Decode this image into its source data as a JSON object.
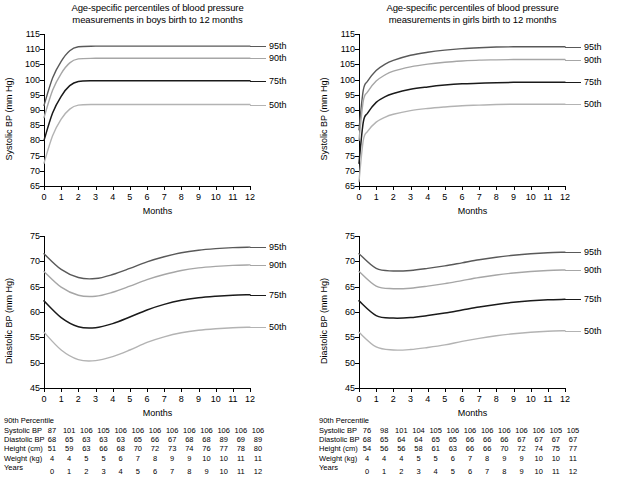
{
  "figure": {
    "title_shared_line1": "Age-specific percentiles of blood pressure",
    "panels": [
      {
        "id": "boys",
        "title_line1": "Age-specific percentiles of blood pressure",
        "title_line2": "measurements in boys birth to 12 months"
      },
      {
        "id": "girls",
        "title_line1": "Age-specific percentiles of blood pressure",
        "title_line2": "measurements in girls birth to 12 months"
      }
    ]
  },
  "common": {
    "xlabel": "Months",
    "percentile_labels": [
      "95th",
      "90th",
      "75th",
      "50th"
    ],
    "table_header": "90th Percentile",
    "table_row_labels": [
      "Systolic BP",
      "Diastolic BP",
      "Height (cm)",
      "Weight (kg)",
      "Years"
    ],
    "colors": {
      "p95": "#595959",
      "p90": "#a6a6a6",
      "p75": "#1a1a1a",
      "p50": "#b3b3b3",
      "axis": "#000000",
      "background": "#ffffff"
    }
  },
  "chart_data": [
    {
      "type": "line",
      "id": "boys-systolic",
      "title": "Age-specific percentiles of blood pressure measurements in boys birth to 12 months",
      "xlabel": "Months",
      "ylabel": "Systolic BP (mm Hg)",
      "xlim": [
        0,
        12
      ],
      "ylim": [
        65,
        115
      ],
      "xticks": [
        0,
        1,
        2,
        3,
        4,
        5,
        6,
        7,
        8,
        9,
        10,
        11,
        12
      ],
      "yticks": [
        65,
        70,
        75,
        80,
        85,
        90,
        95,
        100,
        105,
        110,
        115
      ],
      "grid": false,
      "legend_position": "right-inline",
      "x": [
        0,
        0.5,
        1,
        1.5,
        2,
        3,
        4,
        5,
        6,
        7,
        8,
        9,
        10,
        11,
        12
      ],
      "series": [
        {
          "name": "95th",
          "values": [
            91.5,
            100.5,
            106.0,
            109.5,
            110.8,
            111.0,
            111.0,
            111.0,
            111.0,
            111.0,
            111.0,
            111.0,
            111.0,
            111.0,
            111.0
          ]
        },
        {
          "name": "90th",
          "values": [
            87.5,
            96.5,
            102.0,
            105.5,
            106.8,
            107.0,
            107.0,
            107.0,
            107.0,
            107.0,
            107.0,
            107.0,
            107.0,
            107.0,
            107.0
          ]
        },
        {
          "name": "75th",
          "values": [
            80.0,
            89.0,
            94.5,
            98.0,
            99.4,
            99.6,
            99.6,
            99.6,
            99.6,
            99.6,
            99.6,
            99.6,
            99.6,
            99.6,
            99.6
          ]
        },
        {
          "name": "50th",
          "values": [
            72.5,
            81.5,
            87.0,
            90.3,
            91.6,
            91.8,
            91.8,
            91.8,
            91.8,
            91.8,
            91.8,
            91.8,
            91.8,
            91.8,
            91.8
          ]
        }
      ]
    },
    {
      "type": "line",
      "id": "girls-systolic",
      "title": "Age-specific percentiles of blood pressure measurements in girls birth to 12 months",
      "xlabel": "Months",
      "ylabel": "Systolic BP (mm Hg)",
      "xlim": [
        0,
        12
      ],
      "ylim": [
        65,
        115
      ],
      "xticks": [
        0,
        1,
        2,
        3,
        4,
        5,
        6,
        7,
        8,
        9,
        10,
        11,
        12
      ],
      "yticks": [
        65,
        70,
        75,
        80,
        85,
        90,
        95,
        100,
        105,
        110,
        115
      ],
      "grid": false,
      "legend_position": "right-inline",
      "x": [
        0,
        0.25,
        0.5,
        1,
        1.5,
        2,
        3,
        4,
        5,
        6,
        7,
        8,
        9,
        10,
        11,
        12
      ],
      "series": [
        {
          "name": "95th",
          "values": [
            83.5,
            96.5,
            99.5,
            103.0,
            105.0,
            106.3,
            108.0,
            109.0,
            109.7,
            110.2,
            110.5,
            110.7,
            110.8,
            110.8,
            110.8,
            110.8
          ]
        },
        {
          "name": "90th",
          "values": [
            80.0,
            93.0,
            96.0,
            99.5,
            101.5,
            102.8,
            104.2,
            105.1,
            105.7,
            106.1,
            106.4,
            106.5,
            106.6,
            106.6,
            106.6,
            106.6
          ]
        },
        {
          "name": "75th",
          "values": [
            72.5,
            86.0,
            89.0,
            92.5,
            94.3,
            95.4,
            96.8,
            97.6,
            98.2,
            98.6,
            98.8,
            99.0,
            99.1,
            99.1,
            99.1,
            99.1
          ]
        },
        {
          "name": "50th",
          "values": [
            66.5,
            80.0,
            83.0,
            86.0,
            87.6,
            88.6,
            89.8,
            90.5,
            91.0,
            91.4,
            91.6,
            91.8,
            91.9,
            91.9,
            91.9,
            91.9
          ]
        }
      ]
    },
    {
      "type": "line",
      "id": "boys-diastolic",
      "title": "Age-specific percentiles of blood pressure measurements in boys birth to 12 months",
      "xlabel": "Months",
      "ylabel": "Diastolic BP (mm Hg)",
      "xlim": [
        0,
        12
      ],
      "ylim": [
        45,
        75
      ],
      "xticks": [
        0,
        1,
        2,
        3,
        4,
        5,
        6,
        7,
        8,
        9,
        10,
        11,
        12
      ],
      "yticks": [
        45,
        50,
        55,
        60,
        65,
        70,
        75
      ],
      "grid": false,
      "legend_position": "right-inline",
      "x": [
        0,
        1,
        2,
        3,
        4,
        5,
        6,
        7,
        8,
        9,
        10,
        11,
        12
      ],
      "series": [
        {
          "name": "95th",
          "values": [
            71.5,
            68.4,
            66.8,
            66.6,
            67.4,
            68.6,
            69.9,
            70.9,
            71.7,
            72.2,
            72.5,
            72.7,
            72.8
          ]
        },
        {
          "name": "90th",
          "values": [
            68.0,
            64.9,
            63.3,
            63.1,
            63.9,
            65.1,
            66.4,
            67.4,
            68.2,
            68.7,
            69.0,
            69.2,
            69.3
          ]
        },
        {
          "name": "75th",
          "values": [
            62.2,
            58.9,
            57.1,
            56.9,
            57.7,
            59.0,
            60.4,
            61.5,
            62.3,
            62.8,
            63.1,
            63.3,
            63.4
          ]
        },
        {
          "name": "50th",
          "values": [
            56.0,
            52.5,
            50.6,
            50.4,
            51.2,
            52.5,
            54.0,
            55.1,
            55.9,
            56.4,
            56.7,
            56.9,
            57.0
          ]
        }
      ]
    },
    {
      "type": "line",
      "id": "girls-diastolic",
      "title": "Age-specific percentiles of blood pressure measurements in girls birth to 12 months",
      "xlabel": "Months",
      "ylabel": "Diastolic BP (mm Hg)",
      "xlim": [
        0,
        12
      ],
      "ylim": [
        45,
        75
      ],
      "xticks": [
        0,
        1,
        2,
        3,
        4,
        5,
        6,
        7,
        8,
        9,
        10,
        11,
        12
      ],
      "yticks": [
        45,
        50,
        55,
        60,
        65,
        70,
        75
      ],
      "grid": false,
      "legend_position": "right-inline",
      "x": [
        0,
        1,
        2,
        3,
        4,
        5,
        6,
        7,
        8,
        9,
        10,
        11,
        12
      ],
      "series": [
        {
          "name": "95th",
          "values": [
            71.5,
            68.6,
            68.1,
            68.2,
            68.6,
            69.1,
            69.7,
            70.3,
            70.8,
            71.2,
            71.5,
            71.7,
            71.8
          ]
        },
        {
          "name": "90th",
          "values": [
            68.0,
            65.1,
            64.6,
            64.7,
            65.1,
            65.6,
            66.2,
            66.8,
            67.3,
            67.7,
            68.0,
            68.2,
            68.3
          ]
        },
        {
          "name": "75th",
          "values": [
            62.2,
            59.3,
            58.8,
            58.9,
            59.3,
            59.8,
            60.4,
            61.0,
            61.5,
            61.9,
            62.2,
            62.4,
            62.5
          ]
        },
        {
          "name": "50th",
          "values": [
            56.0,
            53.1,
            52.5,
            52.6,
            53.0,
            53.5,
            54.2,
            54.8,
            55.3,
            55.7,
            56.0,
            56.2,
            56.3
          ]
        }
      ]
    }
  ],
  "tables": {
    "boys": {
      "header": "90th Percentile",
      "rows": [
        {
          "label": "Systolic BP",
          "values": [
            87,
            101,
            106,
            105,
            106,
            106,
            106,
            106,
            106,
            106,
            106,
            106,
            106
          ]
        },
        {
          "label": "Diastolic BP",
          "values": [
            68,
            65,
            63,
            63,
            63,
            65,
            66,
            67,
            68,
            68,
            89,
            69,
            89
          ]
        },
        {
          "label": "Height (cm)",
          "values": [
            51,
            59,
            63,
            66,
            68,
            70,
            72,
            73,
            74,
            76,
            77,
            78,
            80
          ]
        },
        {
          "label": "Weight (kg)",
          "values": [
            4,
            4,
            5,
            5,
            6,
            7,
            8,
            9,
            9,
            10,
            10,
            11,
            11
          ]
        },
        {
          "label": "Years",
          "values": [
            0,
            1,
            2,
            3,
            4,
            5,
            6,
            7,
            8,
            9,
            10,
            11,
            12
          ]
        }
      ]
    },
    "girls": {
      "header": "90th Percentile",
      "rows": [
        {
          "label": "Systolic BP",
          "values": [
            76,
            98,
            101,
            104,
            105,
            106,
            106,
            106,
            106,
            106,
            106,
            105,
            105
          ]
        },
        {
          "label": "Diastolic BP",
          "values": [
            68,
            65,
            64,
            64,
            65,
            65,
            66,
            66,
            66,
            67,
            67,
            67,
            67
          ]
        },
        {
          "label": "Height (cm)",
          "values": [
            54,
            56,
            56,
            58,
            61,
            63,
            66,
            66,
            70,
            72,
            74,
            75,
            77
          ]
        },
        {
          "label": "Weight (kg)",
          "values": [
            4,
            4,
            4,
            5,
            5,
            6,
            7,
            8,
            9,
            9,
            10,
            10,
            11
          ]
        },
        {
          "label": "Years",
          "values": [
            0,
            1,
            2,
            3,
            4,
            5,
            6,
            7,
            8,
            9,
            10,
            11,
            12
          ]
        }
      ]
    }
  }
}
